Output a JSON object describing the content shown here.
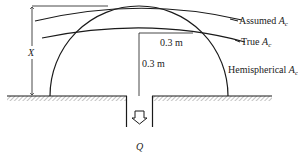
{
  "diagram": {
    "labels": {
      "assumed_ac": {
        "text": "Assumed ",
        "symbol": "A",
        "subscript": "c"
      },
      "true_ac": {
        "text": "True ",
        "symbol": "A",
        "subscript": "c"
      },
      "hemispherical_ac": {
        "text": "Hemispherical ",
        "symbol": "A",
        "subscript": "c"
      },
      "dimension_x": "X",
      "horizontal_distance": "0.3 m",
      "vertical_distance": "0.3 m",
      "flow": "Q"
    },
    "colors": {
      "line": "#1a1a1a",
      "hatch": "#888888",
      "background": "#ffffff"
    }
  }
}
